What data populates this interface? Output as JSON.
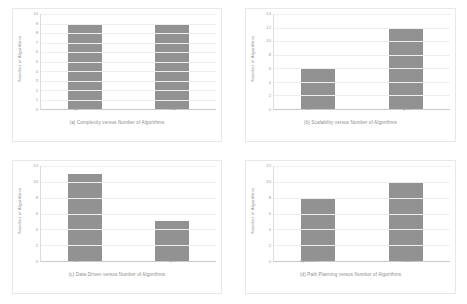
{
  "figure": {
    "y_axis_label": "Number  of Algorithms",
    "bar_color": "#929292",
    "background": "#ffffff"
  },
  "chart_data": [
    {
      "id": "a",
      "type": "bar",
      "title": "(a) Complexity versus Number  of Algorithms",
      "categories": [
        "high",
        "low"
      ],
      "values": [
        9,
        9
      ],
      "xlabel": "",
      "ylabel": "Number  of Algorithms",
      "ylim": [
        0,
        10
      ],
      "yticks": [
        0,
        1,
        2,
        3,
        4,
        5,
        6,
        7,
        8,
        9,
        10
      ],
      "grid": true,
      "legend": "none"
    },
    {
      "id": "b",
      "type": "bar",
      "title": "(b) Scalability versus Number of Algorithms",
      "categories": [
        "no",
        "yes"
      ],
      "values": [
        6,
        12
      ],
      "xlabel": "",
      "ylabel": "Number  of Algorithms",
      "ylim": [
        0,
        14
      ],
      "yticks": [
        0,
        2,
        4,
        6,
        8,
        10,
        12,
        14
      ],
      "grid": true,
      "legend": "none"
    },
    {
      "id": "c",
      "type": "bar",
      "title": "(c) Data-Driven versus Number  of Algorithms",
      "categories": [
        "no",
        "yes"
      ],
      "values": [
        11,
        5
      ],
      "xlabel": "",
      "ylabel": "Number  of Algorithms",
      "ylim": [
        0,
        12
      ],
      "yticks": [
        0,
        2,
        4,
        6,
        8,
        10,
        12
      ],
      "grid": true,
      "legend": "none"
    },
    {
      "id": "d",
      "type": "bar",
      "title": "(d) Path Planning  versus Number of Algorithms",
      "categories": [
        "dynamic",
        "static"
      ],
      "values": [
        8,
        10
      ],
      "xlabel": "",
      "ylabel": "Number of Algorithms",
      "ylim": [
        0,
        12
      ],
      "yticks": [
        0,
        2,
        4,
        6,
        8,
        10,
        12
      ],
      "grid": true,
      "legend": "none"
    }
  ]
}
